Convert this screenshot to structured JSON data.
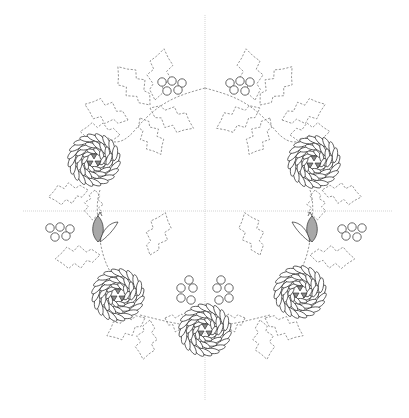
{
  "diagram": {
    "symmetry": "mirrored left-right",
    "guidelines": [
      "vertical-center",
      "horizontal-center"
    ],
    "elements": {
      "roses": [
        {
          "id": "rose-top-left",
          "stitch": "lazy daisy petals with satin-stitch center"
        },
        {
          "id": "rose-top-right",
          "stitch": "lazy daisy petals with satin-stitch center"
        },
        {
          "id": "rose-middle-left",
          "stitch": "lazy daisy petals with satin-stitch center"
        },
        {
          "id": "rose-middle-right",
          "stitch": "lazy daisy petals with satin-stitch center"
        },
        {
          "id": "rose-bottom-center",
          "stitch": "lazy daisy petals with satin-stitch center"
        }
      ],
      "berry_clusters": [
        {
          "id": "berries-top-left",
          "count": 5
        },
        {
          "id": "berries-top-right",
          "count": 5
        },
        {
          "id": "berries-middle-left",
          "count": 5
        },
        {
          "id": "berries-middle-right",
          "count": 5
        },
        {
          "id": "berries-bottom-left",
          "count": 5
        },
        {
          "id": "berries-bottom-right",
          "count": 5
        }
      ],
      "buds": [
        {
          "id": "bud-left"
        },
        {
          "id": "bud-right"
        }
      ],
      "leaf_style": "dashed running-stitch holly leaves",
      "colors": {
        "outline": "#2a2a2a",
        "dashed_leaf": "#7a7a7a",
        "fill_shade": "#a8a8a8",
        "guide": "#c8c8c8",
        "background": "#ffffff"
      }
    }
  }
}
